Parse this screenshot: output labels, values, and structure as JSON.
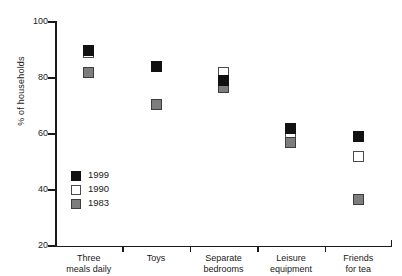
{
  "chart_data": {
    "type": "scatter",
    "title": "",
    "xlabel": "",
    "ylabel": "% of households",
    "ylim": [
      20,
      100
    ],
    "yticks": [
      20,
      40,
      60,
      80,
      100
    ],
    "grid": false,
    "legend_position": "inside-lower-left",
    "categories": [
      "Three meals daily",
      "Toys",
      "Separate bedrooms",
      "Leisure equipment",
      "Friends for tea"
    ],
    "category_lines": [
      [
        "Three",
        "meals daily"
      ],
      [
        "Toys",
        ""
      ],
      [
        "Separate",
        "bedrooms"
      ],
      [
        "Leisure",
        "equipment"
      ],
      [
        "Friends",
        "for tea"
      ]
    ],
    "series": [
      {
        "name": "1999",
        "color": "#111111",
        "style": "filled-black-square",
        "values": [
          90,
          84,
          79,
          62,
          59
        ]
      },
      {
        "name": "1990",
        "color": "#ffffff",
        "style": "open-white-square",
        "values": [
          89,
          84,
          82,
          59,
          52
        ]
      },
      {
        "name": "1983",
        "color": "#7d7d7d",
        "style": "filled-gray-square",
        "values": [
          82,
          70.5,
          76.5,
          57,
          36.5
        ]
      }
    ]
  },
  "axis": {
    "y_title": "% of households",
    "y_tick_labels": [
      "100",
      "80",
      "60",
      "40",
      "20"
    ]
  },
  "legend": {
    "items": [
      {
        "label": "1999",
        "color": "#111111"
      },
      {
        "label": "1990",
        "color": "#ffffff"
      },
      {
        "label": "1983",
        "color": "#7d7d7d"
      }
    ]
  }
}
